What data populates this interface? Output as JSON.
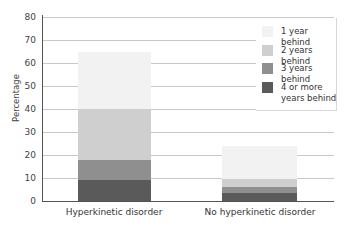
{
  "chart_data": {
    "type": "bar",
    "stacked": true,
    "title": "",
    "xlabel": "",
    "ylabel": "Percentage",
    "ylim": [
      0,
      80
    ],
    "yticks": [
      0,
      10,
      20,
      30,
      40,
      50,
      60,
      70,
      80
    ],
    "grid": true,
    "legend_position": "upper right",
    "categories": [
      "Hyperkinetic disorder",
      "No hyperkinetic disorder"
    ],
    "series": [
      {
        "name": "4 or more years behind",
        "color": "#5a5a5a",
        "values": [
          9,
          3.5
        ]
      },
      {
        "name": "3 years behind",
        "color": "#8f8f8f",
        "values": [
          9,
          2.5
        ]
      },
      {
        "name": "2 years behind",
        "color": "#cfcfcf",
        "values": [
          22,
          3.5
        ]
      },
      {
        "name": "1 year behind",
        "color": "#f2f2f2",
        "values": [
          25,
          14.5
        ]
      }
    ],
    "totals": [
      65,
      24
    ]
  },
  "axis": {
    "ylabel": "Percentage",
    "yticks": [
      "0",
      "10",
      "20",
      "30",
      "40",
      "50",
      "60",
      "70",
      "80"
    ],
    "categories": [
      "Hyperkinetic disorder",
      "No hyperkinetic disorder"
    ]
  },
  "legend": {
    "items": [
      {
        "label": "1 year behind",
        "color": "#f2f2f2"
      },
      {
        "label": "2 years behind",
        "color": "#cfcfcf"
      },
      {
        "label": "3 years behind",
        "color": "#8f8f8f"
      },
      {
        "label": "4 or more years behind",
        "color": "#5a5a5a"
      }
    ]
  }
}
